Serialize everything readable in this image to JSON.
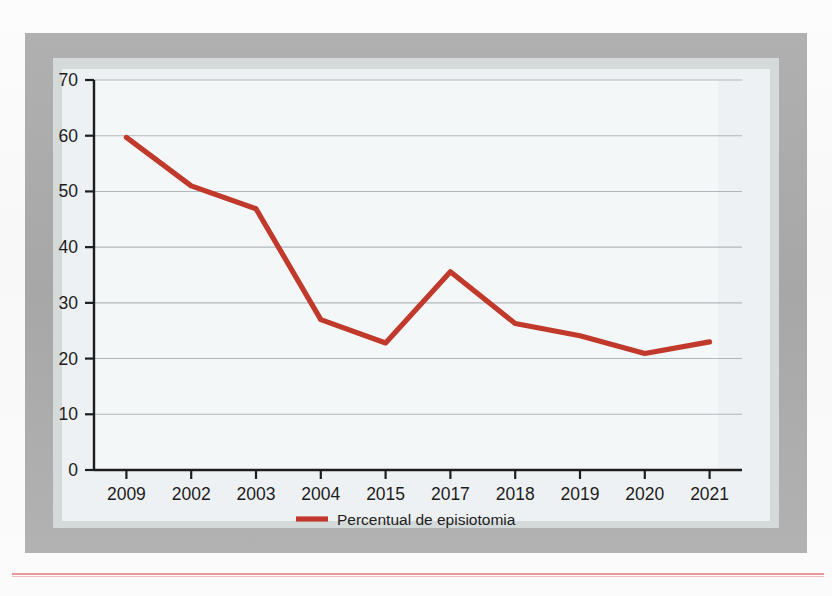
{
  "figure": {
    "legend_label": "Percentual de episiotomia",
    "series_color": "#c0392b",
    "gridline_color": "#9aa3aa",
    "axis_color": "#1d1d1d",
    "plate_color": "#f4f7f8",
    "frame_color": "#adadad",
    "rule_color": "#e8979a"
  },
  "chart_data": {
    "type": "line",
    "title": "",
    "subtitle": "",
    "xlabel": "",
    "ylabel": "",
    "categories": [
      "2009",
      "2002",
      "2003",
      "2004",
      "2015",
      "2017",
      "2018",
      "2019",
      "2020",
      "2021"
    ],
    "series": [
      {
        "name": "Percentual de episiotomia",
        "color": "#c0392b",
        "values": [
          59.7,
          51.0,
          46.9,
          27.0,
          22.8,
          35.6,
          26.3,
          24.1,
          20.9,
          23.0
        ]
      }
    ],
    "ylim": [
      0,
      70
    ],
    "yticks": [
      0,
      10,
      20,
      30,
      40,
      50,
      60,
      70
    ],
    "ytick_labels": [
      "0",
      "10",
      "20",
      "30",
      "40",
      "50",
      "60",
      "70"
    ],
    "xtick_labels": [
      "2009",
      "2002",
      "2003",
      "2004",
      "2015",
      "2017",
      "2018",
      "2019",
      "2020",
      "2021"
    ],
    "grid": true,
    "grid_axis": "y",
    "legend": true,
    "legend_position": "bottom-center",
    "annotations": []
  },
  "bleed_through": {
    "note": "faint mirrored text showing through from the reverse side of the scanned page",
    "lines": [
      "parto instrumentados",
      "um sinal: de canulo, ou",
      "ade, quando na sala de",
      "parto, a episiotomia pode se",
      "sentir o ataque do nascime",
      "das sindromes decorrentes d",
      "todas que ainda sao consideradas",
      "intervencionista e mais",
      "nao ha consenso sobre a",
      "ainda em dia, mundo mais",
      "referencia que com 24,19 de"
    ]
  }
}
